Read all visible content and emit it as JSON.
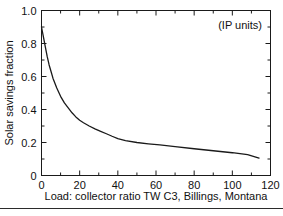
{
  "chart_data": {
    "type": "line",
    "title": "",
    "annotation": "(IP units)",
    "xlabel": "Load: collector ratio TW C3, Billings, Montana",
    "ylabel": "Solar savings fraction",
    "xlim": [
      0,
      120
    ],
    "ylim": [
      0,
      1.0
    ],
    "grid": false,
    "legend": null,
    "x_ticks": [
      0,
      20,
      40,
      60,
      80,
      100,
      120
    ],
    "x_tick_labels": [
      "0",
      "20",
      "40",
      "60",
      "80",
      "100",
      "120"
    ],
    "x_minor_ticks": [
      10,
      30,
      50,
      70,
      90,
      110
    ],
    "y_ticks": [
      0,
      0.2,
      0.4,
      0.6,
      0.8,
      1.0
    ],
    "y_tick_labels": [
      "0",
      "0.2",
      "0.4",
      "0.6",
      "0.8",
      "1.0"
    ],
    "y_minor_ticks": [
      0.1,
      0.3,
      0.5,
      0.7,
      0.9
    ],
    "series": [
      {
        "name": "Solar savings fraction",
        "color": "#1a1a1a",
        "x": [
          0,
          1,
          2,
          3,
          4,
          5,
          6,
          8,
          10,
          12,
          14,
          16,
          18,
          20,
          22,
          25,
          28,
          31,
          34,
          37,
          40,
          44,
          50,
          56,
          62,
          70,
          80,
          90,
          100,
          108,
          114
        ],
        "y": [
          0.9,
          0.84,
          0.78,
          0.72,
          0.67,
          0.63,
          0.59,
          0.53,
          0.48,
          0.44,
          0.41,
          0.38,
          0.355,
          0.335,
          0.32,
          0.3,
          0.283,
          0.268,
          0.253,
          0.238,
          0.224,
          0.212,
          0.2,
          0.192,
          0.185,
          0.175,
          0.162,
          0.15,
          0.138,
          0.126,
          0.105
        ]
      }
    ]
  },
  "axes": {
    "frame_color": "#1a1a1a",
    "background": "#ffffff"
  }
}
